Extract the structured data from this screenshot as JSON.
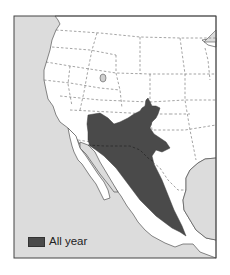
{
  "map": {
    "type": "species range map",
    "region": "Western North America and Mexico",
    "colors": {
      "ocean": "#dcdcdc",
      "land": "#ffffff",
      "range_all_year": "#4a4a4a",
      "border": "#555555",
      "frame": "#444444"
    }
  },
  "legend": {
    "items": [
      {
        "label": "All year",
        "color": "#4a4a4a"
      }
    ]
  }
}
